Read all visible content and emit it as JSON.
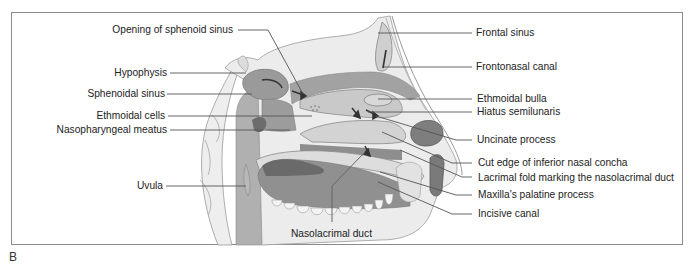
{
  "figure": {
    "panel_label": "B",
    "labels_left": [
      {
        "id": "opening-sphenoid",
        "text": "Opening of sphenoid sinus"
      },
      {
        "id": "hypophysis",
        "text": "Hypophysis"
      },
      {
        "id": "sphenoidal-sinus",
        "text": "Sphenoidal sinus"
      },
      {
        "id": "ethmoidal-cells",
        "text": "Ethmoidal cells"
      },
      {
        "id": "nasopharyngeal-meatus",
        "text": "Nasopharyngeal meatus"
      },
      {
        "id": "uvula",
        "text": "Uvula"
      }
    ],
    "labels_right": [
      {
        "id": "frontal-sinus",
        "text": "Frontal sinus"
      },
      {
        "id": "frontonasal-canal",
        "text": "Frontonasal canal"
      },
      {
        "id": "ethmoidal-bulla",
        "text": "Ethmoidal bulla"
      },
      {
        "id": "hiatus-semilunaris",
        "text": "Hiatus semilunaris"
      },
      {
        "id": "uncinate-process",
        "text": "Uncinate process"
      },
      {
        "id": "cut-edge-concha",
        "text": "Cut edge of inferior nasal concha"
      },
      {
        "id": "lacrimal-fold",
        "text": "Lacrimal fold marking the nasolacrimal duct"
      },
      {
        "id": "palatine-process",
        "text": "Maxilla's palatine process"
      },
      {
        "id": "incisive-canal",
        "text": "Incisive canal"
      }
    ],
    "labels_bottom": [
      {
        "id": "nasolacrimal-duct",
        "text": "Nasolacrimal duct"
      }
    ],
    "colors": {
      "frame": "#8a8a8a",
      "leader": "#555555",
      "bone_light": "#e6e6e6",
      "tissue_mid": "#b5b5b5",
      "tissue_dark": "#8c8c8c",
      "cavity_dark": "#6e6e6e",
      "arrow": "#3a3a3a"
    }
  }
}
